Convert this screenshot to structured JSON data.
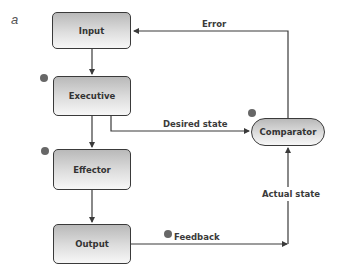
{
  "panel_label": "a",
  "nodes": {
    "input": "Input",
    "executive": "Executive",
    "effector": "Effector",
    "output": "Output",
    "comparator": "Comparator"
  },
  "edges": {
    "error": "Error",
    "desired_state": "Desired state",
    "actual_state": "Actual state",
    "feedback": "Feedback"
  },
  "colors": {
    "box_border": "#3a3a3a",
    "box_gradient_top": "#b9b9b9",
    "box_gradient_bottom": "#f7f7f7",
    "dot": "#676767",
    "line": "#3a3a3a"
  }
}
